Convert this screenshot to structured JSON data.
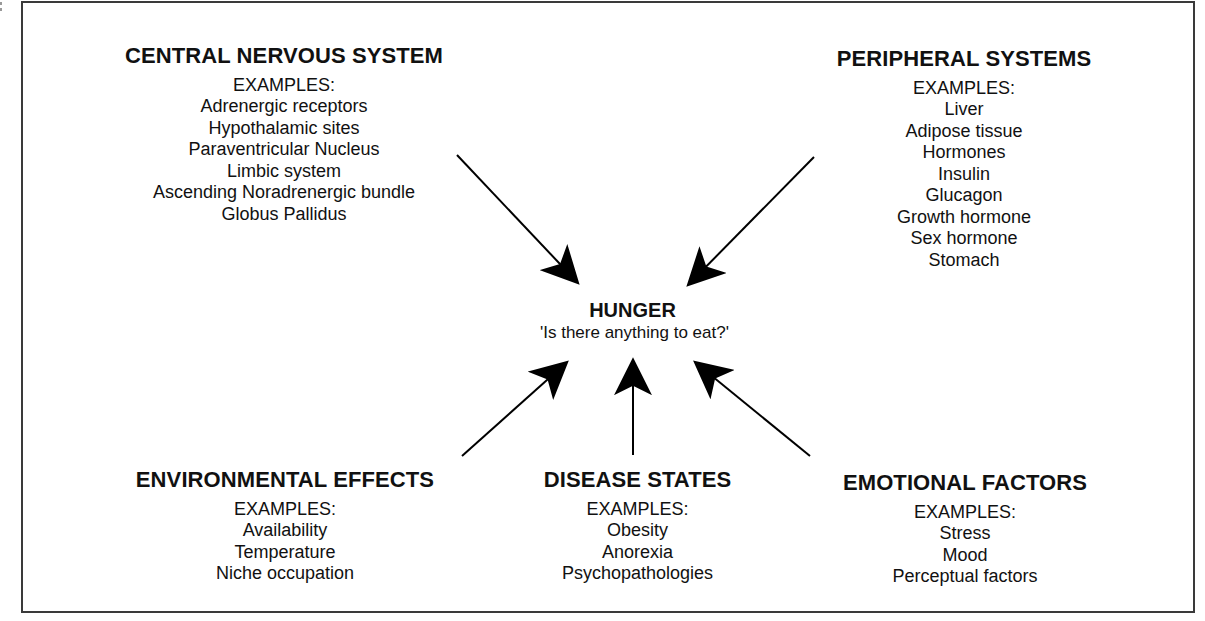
{
  "diagram": {
    "center": {
      "title": "HUNGER",
      "subtitle": "'Is there anything to eat?'"
    },
    "examples_label": "EXAMPLES:",
    "groups": {
      "cns": {
        "title": "CENTRAL NERVOUS SYSTEM",
        "items": [
          "Adrenergic receptors",
          "Hypothalamic sites",
          "Paraventricular Nucleus",
          "Limbic system",
          "Ascending Noradrenergic bundle",
          "Globus Pallidus"
        ]
      },
      "peripheral": {
        "title": "PERIPHERAL SYSTEMS",
        "items": [
          "Liver",
          "Adipose tissue",
          "Hormones",
          "Insulin",
          "Glucagon",
          "Growth hormone",
          "Sex hormone",
          "Stomach"
        ]
      },
      "environmental": {
        "title": "ENVIRONMENTAL EFFECTS",
        "items": [
          "Availability",
          "Temperature",
          "Niche occupation"
        ]
      },
      "disease": {
        "title": "DISEASE STATES",
        "items": [
          "Obesity",
          "Anorexia",
          "Psychopathologies"
        ]
      },
      "emotional": {
        "title": "EMOTIONAL FACTORS",
        "items": [
          "Stress",
          "Mood",
          "Perceptual factors"
        ]
      }
    },
    "arrows": [
      {
        "from": "cns",
        "to": "center"
      },
      {
        "from": "peripheral",
        "to": "center"
      },
      {
        "from": "environmental",
        "to": "center"
      },
      {
        "from": "disease",
        "to": "center"
      },
      {
        "from": "emotional",
        "to": "center"
      }
    ],
    "colors": {
      "line": "#000000",
      "frame": "#3a3a3a",
      "background": "#ffffff"
    }
  }
}
